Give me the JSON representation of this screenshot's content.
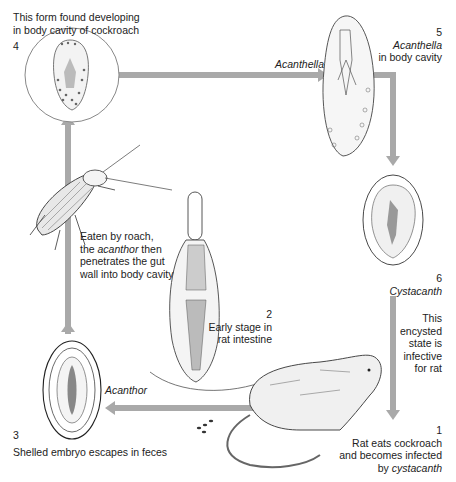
{
  "arrow_color": "#a9a9a9",
  "stages": [
    {
      "number": "1",
      "lines": [
        "Rat eats cockroach",
        "and becomes infected"
      ],
      "last_prefix": "by ",
      "last_italic": "cystacanth"
    },
    {
      "number": "2",
      "lines": [
        "Early stage in",
        "rat intestine"
      ]
    },
    {
      "number": "3",
      "caption": "Shelled embryo escapes in feces"
    },
    {
      "number": "4",
      "lines": [
        "This form found developing",
        "in body cavity of cockroach"
      ]
    },
    {
      "number": "5",
      "name": "Acanthella",
      "sub": "in body cavity"
    },
    {
      "number": "6",
      "name": "Cystacanth",
      "lines": [
        "This",
        "encysted",
        "state is",
        "infective",
        "for rat"
      ]
    }
  ],
  "arrow_labels": {
    "top": "Acanthella",
    "bottom": "Acanthor"
  },
  "roach_note": {
    "line1": "Eaten by roach,",
    "line2_pre": "the ",
    "line2_italic": "acanthor",
    "line2_post": " then",
    "line3": "penetrates the gut",
    "line4": "wall into body cavity"
  }
}
